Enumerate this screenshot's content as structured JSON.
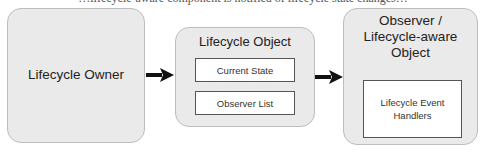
{
  "top_clipped_text": "…lifecycle-aware component is notified of lifecycle state changes…",
  "nodes": {
    "owner": {
      "label": "Lifecycle Owner"
    },
    "lifecycle_object": {
      "label": "Lifecycle Object",
      "children": [
        "Current State",
        "Observer List"
      ]
    },
    "observer": {
      "label": "Observer / Lifecycle-aware Object",
      "label_lines": [
        "Observer /",
        "Lifecycle-aware",
        "Object"
      ],
      "children": [
        "Lifecycle Event Handlers"
      ],
      "child_lines": [
        "Lifecycle Event",
        "Handlers"
      ]
    }
  },
  "edges": [
    {
      "from": "Lifecycle Owner",
      "to": "Lifecycle Object"
    },
    {
      "from": "Lifecycle Object",
      "to": "Observer / Lifecycle-aware Object"
    }
  ],
  "colors": {
    "box_fill": "#eaeaea",
    "box_border": "#bdbdbd",
    "arrow": "#111111",
    "inner_fill": "#ffffff"
  }
}
